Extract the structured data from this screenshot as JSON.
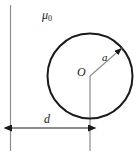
{
  "figure": {
    "name": "circular-conductor-near-boundary-diagram",
    "background_color": "#ffffff",
    "stroke_color": "#1a1a1a",
    "thin_stroke_color": "#8c8c8c",
    "labels": {
      "permeability": "μ",
      "permeability_subscript": "0",
      "center": "O",
      "radius": "a",
      "distance": "d"
    },
    "geometry": {
      "boundary_line": {
        "x": 10,
        "y_top": 5,
        "y_bottom": 151
      },
      "center_line": {
        "x": 90,
        "y_top": 76,
        "y_bottom": 151
      },
      "circle": {
        "cx": 90,
        "cy": 76,
        "r": 44
      },
      "radius_arrow": {
        "x1": 90,
        "y1": 76,
        "x2": 125,
        "y2": 45
      },
      "dimension_line": {
        "x1": 11,
        "x2": 89,
        "y": 128
      }
    }
  }
}
